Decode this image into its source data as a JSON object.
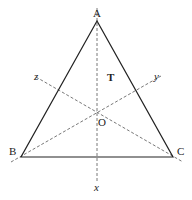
{
  "diagram": {
    "type": "equilateral-triangle-with-symmetry-axes",
    "vertices": {
      "A": {
        "label": "A"
      },
      "B": {
        "label": "B"
      },
      "C": {
        "label": "C"
      }
    },
    "center": {
      "label": "O"
    },
    "region_label": "T",
    "axes": [
      {
        "name": "x",
        "label": "x",
        "through": [
          "A",
          "O"
        ]
      },
      {
        "name": "y",
        "label": "y",
        "through": [
          "B",
          "O"
        ]
      },
      {
        "name": "z",
        "label": "z",
        "through": [
          "C",
          "O"
        ]
      }
    ],
    "colors": {
      "stroke": "#222222",
      "axis": "#555555",
      "background": "#ffffff"
    }
  }
}
